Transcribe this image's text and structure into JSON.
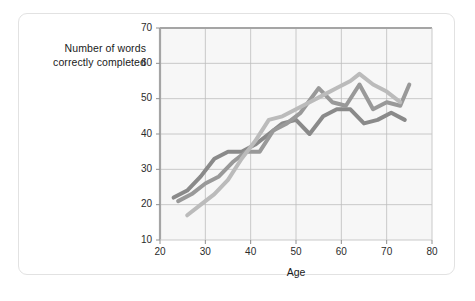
{
  "chart_data": {
    "type": "line",
    "title": "",
    "subtitle": "",
    "xlabel": "Age",
    "ylabel": "Number of words correctly completed",
    "ylabel_lines": [
      "Number of words",
      "correctly completed"
    ],
    "xlim": [
      20,
      80
    ],
    "ylim": [
      10,
      70
    ],
    "xticks": [
      20,
      30,
      40,
      50,
      60,
      70,
      80
    ],
    "yticks": [
      10,
      20,
      30,
      40,
      50,
      60,
      70
    ],
    "grid": true,
    "legend": null,
    "legend_position": "none",
    "annotations": [],
    "plot_background": "#f7f7f7",
    "grid_color": "#bdbdbd",
    "frame_color": "#9a9a9a",
    "series": [
      {
        "name": "series-dark-gray",
        "color": "#8a8a8a",
        "line_width": 4,
        "x": [
          23,
          26,
          29,
          32,
          35,
          38,
          41,
          44,
          47,
          50,
          53,
          56,
          59,
          62,
          65,
          68,
          71,
          74
        ],
        "y": [
          22,
          24,
          28,
          33,
          35,
          35,
          37,
          40,
          43,
          44,
          40,
          45,
          47,
          47,
          43,
          44,
          46,
          44
        ]
      },
      {
        "name": "series-medium-gray",
        "color": "#999999",
        "line_width": 4,
        "x": [
          24,
          27,
          30,
          33,
          36,
          39,
          42,
          45,
          48,
          51,
          55,
          58,
          61,
          64,
          67,
          70,
          73,
          75
        ],
        "y": [
          21,
          23,
          26,
          28,
          32,
          35,
          35,
          41,
          43,
          46,
          53,
          49,
          48,
          54,
          47,
          49,
          48,
          54
        ]
      },
      {
        "name": "series-light-gray",
        "color": "#bbbbbb",
        "line_width": 4,
        "x": [
          26,
          29,
          32,
          35,
          38,
          41,
          44,
          47,
          50,
          53,
          56,
          59,
          62,
          64,
          67,
          70,
          73
        ],
        "y": [
          17,
          20,
          23,
          27,
          33,
          38,
          44,
          45,
          47,
          49,
          51,
          53,
          55,
          57,
          54,
          52,
          49
        ]
      }
    ]
  },
  "axes": {
    "y_title_lines": [
      "Number of words",
      "correctly completed"
    ],
    "x_title": "Age",
    "y_tick_labels": [
      "10",
      "20",
      "30",
      "40",
      "50",
      "60",
      "70"
    ],
    "x_tick_labels": [
      "20",
      "30",
      "40",
      "50",
      "60",
      "70",
      "80"
    ]
  }
}
